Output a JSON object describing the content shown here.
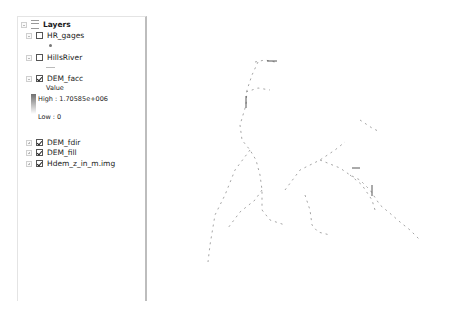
{
  "toc": {
    "root_label": "Layers",
    "layers": [
      {
        "name": "HR_gages",
        "checked": false,
        "expanded": true,
        "symbol": "point"
      },
      {
        "name": "HillsRiver",
        "checked": false,
        "expanded": true,
        "symbol": "line"
      },
      {
        "name": "DEM_facc",
        "checked": true,
        "expanded": true,
        "symbol": "stretched-ramp",
        "legend": {
          "field": "Value",
          "high": "High : 1.70585e+006",
          "low": "Low : 0"
        }
      },
      {
        "name": "DEM_fdir",
        "checked": true,
        "expanded": false
      },
      {
        "name": "DEM_fill",
        "checked": true,
        "expanded": false
      },
      {
        "name": "Hdem_z_in_m.img",
        "checked": true,
        "expanded": false
      }
    ]
  },
  "map": {
    "content": "stream network raster (flow accumulation)",
    "colors": {
      "background": "#ffffff",
      "stream": "#555555"
    }
  }
}
